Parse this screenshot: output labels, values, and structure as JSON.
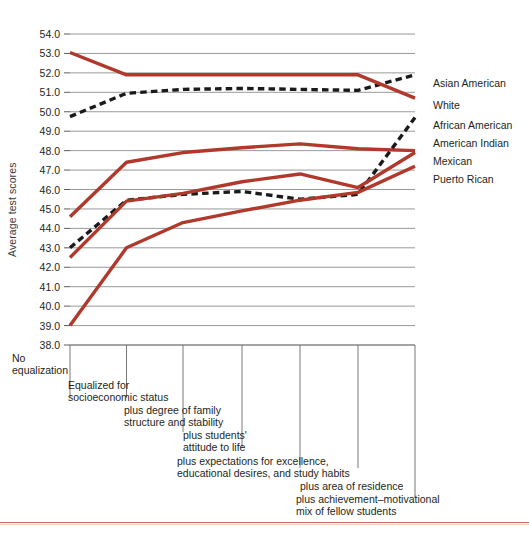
{
  "chart_data": {
    "type": "line",
    "title": "",
    "xlabel": "",
    "ylabel": "Average test scores",
    "ylim": [
      38.0,
      54.0
    ],
    "ytick_step": 1.0,
    "grid": true,
    "legend_position": "right",
    "yticks": [
      "54.0",
      "53.0",
      "52.0",
      "51.0",
      "50.0",
      "49.0",
      "48.0",
      "47.0",
      "46.0",
      "45.0",
      "44.0",
      "43.0",
      "42.0",
      "41.0",
      "40.0",
      "39.0",
      "38.0"
    ],
    "categories": [
      "No equalization",
      "Equalized for socioeconomic status",
      "plus degree of family structure and stability",
      "plus students' attitude to life",
      "plus expectations for excellence, educational desires, and study habits",
      "plus area of residence",
      "plus achievement–motivational mix of fellow students"
    ],
    "category_lines": [
      [
        "No",
        "equalization"
      ],
      [
        "Equalized for",
        "socioeconomic status"
      ],
      [
        "plus degree of family",
        "structure and stability"
      ],
      [
        "plus students'",
        "attitude to life"
      ],
      [
        "plus expectations for excellence,",
        "educational desires, and study habits"
      ],
      [
        "plus area of residence"
      ],
      [
        "plus achievement–motivational",
        "mix of fellow students"
      ]
    ],
    "series": [
      {
        "name": "Asian American",
        "style": "dashed",
        "color": "#1a1a1a",
        "values": [
          49.75,
          50.95,
          51.15,
          51.2,
          51.15,
          51.1,
          51.9
        ]
      },
      {
        "name": "White",
        "style": "solid",
        "color": "#b0392c",
        "values": [
          53.05,
          51.9,
          51.9,
          51.9,
          51.9,
          51.9,
          50.7
        ]
      },
      {
        "name": "African American",
        "style": "solid",
        "color": "#b0392c",
        "values": [
          44.6,
          47.4,
          47.9,
          48.15,
          48.35,
          48.1,
          48.0
        ]
      },
      {
        "name": "American Indian",
        "style": "dashed",
        "color": "#1a1a1a",
        "values": [
          43.0,
          45.45,
          45.75,
          45.9,
          45.5,
          45.75,
          49.7
        ]
      },
      {
        "name": "Mexican",
        "style": "solid",
        "color": "#b0392c",
        "values": [
          42.5,
          45.4,
          45.8,
          46.4,
          46.8,
          46.1,
          47.9
        ]
      },
      {
        "name": "Puerto Rican",
        "style": "solid",
        "color": "#b0392c",
        "values": [
          39.0,
          43.0,
          44.3,
          44.9,
          45.45,
          45.85,
          47.2
        ]
      }
    ]
  },
  "legend": {
    "entries": [
      {
        "label": "Asian American"
      },
      {
        "label": "White"
      },
      {
        "label": "African American"
      },
      {
        "label": "American Indian"
      },
      {
        "label": "Mexican"
      },
      {
        "label": "Puerto Rican"
      }
    ]
  }
}
